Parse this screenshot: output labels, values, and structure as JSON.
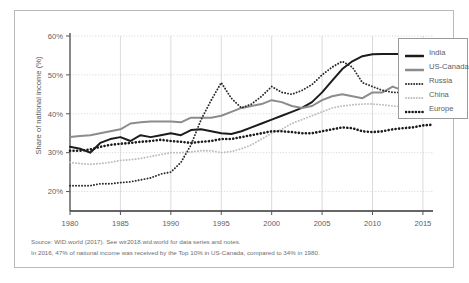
{
  "figure": {
    "caption_line1": "Source: WID.world (2017). See wir2018.wid.world for data series and notes.",
    "caption_line2": "In 2016, 47% of national income was received by the Top 10% in US-Canada, compared to 34% in 1980."
  },
  "legend": {
    "items": [
      {
        "label": "India",
        "style": "solid",
        "color": "#1c1c1c",
        "width": 2.6
      },
      {
        "label": "US-Canada",
        "style": "solid",
        "color": "#8c8c8c",
        "width": 2.6
      },
      {
        "label": "Russia",
        "style": "dotted-fine",
        "color": "#2b2b2b",
        "width": 1.9
      },
      {
        "label": "China",
        "style": "dotted-fine",
        "color": "#bcbcbc",
        "width": 1.9
      },
      {
        "label": "Europe",
        "style": "dotted-bold",
        "color": "#1c1c1c",
        "width": 2.4
      }
    ]
  },
  "chart_data": {
    "type": "line",
    "title": "",
    "subtitle": "",
    "xlabel": "",
    "ylabel": "Share of national income (%)",
    "xlim": [
      1980,
      2016
    ],
    "ylim": [
      15,
      60
    ],
    "xticks": [
      1980,
      1985,
      1990,
      1995,
      2000,
      2005,
      2010,
      2015
    ],
    "xticklabels": [
      "1980",
      "1985",
      "1990",
      "1995",
      "2000",
      "2005",
      "2010",
      "2015"
    ],
    "yticks": [
      20,
      30,
      40,
      50,
      60
    ],
    "yticklabels": [
      "20%",
      "30%",
      "40%",
      "50%",
      "60%"
    ],
    "grid": true,
    "grid_axis": "both",
    "legend_position": "right-top",
    "x": [
      1980,
      1981,
      1982,
      1983,
      1984,
      1985,
      1986,
      1987,
      1988,
      1989,
      1990,
      1991,
      1992,
      1993,
      1994,
      1995,
      1996,
      1997,
      1998,
      1999,
      2000,
      2001,
      2002,
      2003,
      2004,
      2005,
      2006,
      2007,
      2008,
      2009,
      2010,
      2011,
      2012,
      2013,
      2014,
      2015,
      2016
    ],
    "series": [
      {
        "name": "India",
        "color": "#1c1c1c",
        "style": "solid",
        "values": [
          31.5,
          31.0,
          30.0,
          32.5,
          33.5,
          34.0,
          33.0,
          34.5,
          34.0,
          34.5,
          35.0,
          34.5,
          35.8,
          36.0,
          35.5,
          35.0,
          34.8,
          35.5,
          36.5,
          37.5,
          38.5,
          39.5,
          40.5,
          41.5,
          43.0,
          45.5,
          48.5,
          51.5,
          53.5,
          54.8,
          55.3,
          55.4,
          55.4,
          55.4,
          55.5,
          55.5,
          55.5
        ]
      },
      {
        "name": "US-Canada",
        "color": "#8c8c8c",
        "style": "solid",
        "values": [
          34.0,
          34.3,
          34.5,
          35.0,
          35.5,
          36.0,
          37.5,
          37.8,
          38.0,
          38.0,
          38.0,
          37.8,
          39.0,
          39.0,
          39.0,
          39.5,
          40.5,
          41.5,
          42.0,
          42.5,
          43.5,
          43.0,
          42.0,
          41.5,
          42.0,
          43.5,
          44.5,
          45.0,
          44.5,
          44.0,
          45.5,
          45.5,
          47.0,
          46.0,
          46.5,
          47.0,
          47.0
        ]
      },
      {
        "name": "Russia",
        "color": "#2b2b2b",
        "style": "dotted-fine",
        "values": [
          21.5,
          21.5,
          21.5,
          22.0,
          22.0,
          22.3,
          22.5,
          23.0,
          23.5,
          24.5,
          25.0,
          27.5,
          32.0,
          38.5,
          43.5,
          48.0,
          44.0,
          41.5,
          42.5,
          44.5,
          47.0,
          45.5,
          45.0,
          46.0,
          47.5,
          50.0,
          52.0,
          53.5,
          52.0,
          48.0,
          47.0,
          46.0,
          45.5,
          45.5,
          46.0,
          46.0,
          46.0
        ]
      },
      {
        "name": "China",
        "color": "#bcbcbc",
        "style": "dotted-fine",
        "values": [
          27.5,
          27.2,
          27.0,
          27.2,
          27.5,
          28.0,
          28.2,
          28.5,
          29.0,
          29.5,
          30.0,
          30.0,
          30.2,
          30.5,
          30.5,
          30.0,
          30.3,
          31.0,
          32.0,
          33.5,
          35.0,
          36.0,
          37.5,
          38.5,
          39.5,
          40.5,
          41.5,
          42.0,
          42.3,
          42.5,
          42.5,
          42.3,
          42.0,
          41.8,
          41.5,
          41.5,
          41.5
        ]
      },
      {
        "name": "Europe",
        "color": "#1c1c1c",
        "style": "dotted-bold",
        "values": [
          30.5,
          30.5,
          30.8,
          31.5,
          32.0,
          32.3,
          32.5,
          32.8,
          33.0,
          33.3,
          33.0,
          32.8,
          32.5,
          32.8,
          33.0,
          33.5,
          33.5,
          34.0,
          34.5,
          35.0,
          35.5,
          35.5,
          35.3,
          35.0,
          35.0,
          35.5,
          36.0,
          36.5,
          36.3,
          35.5,
          35.3,
          35.5,
          36.0,
          36.3,
          36.5,
          37.0,
          37.2
        ]
      }
    ]
  }
}
